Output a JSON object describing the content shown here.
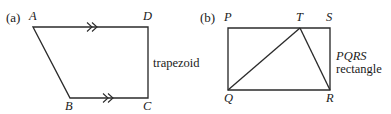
{
  "figure": {
    "width": 391,
    "height": 114,
    "background_color": "#ffffff",
    "stroke_color": "#2b2b2b",
    "text_color": "#1a1a1a"
  },
  "panel_a": {
    "part_label": "(a)",
    "part_label_pos": {
      "x": 6,
      "y": 22
    },
    "shape_name": "trapezoid",
    "caption": "trapezoid",
    "caption_pos": {
      "x": 153,
      "y": 67
    },
    "polygon_points": "33,27 148,27 148,98 70,98",
    "vertices": [
      {
        "name": "A",
        "label": "A",
        "x": 33,
        "y": 27,
        "label_x": 29,
        "label_y": 20
      },
      {
        "name": "D",
        "label": "D",
        "x": 148,
        "y": 27,
        "label_x": 143,
        "label_y": 20
      },
      {
        "name": "C",
        "label": "C",
        "x": 148,
        "y": 98,
        "label_x": 143,
        "label_y": 110
      },
      {
        "name": "B",
        "label": "B",
        "x": 70,
        "y": 98,
        "label_x": 65,
        "label_y": 110
      }
    ],
    "parallel_marks": [
      {
        "name": "parallel-mark-ad",
        "on_segment": "AD",
        "count": 2,
        "glyph": "double-chevron",
        "x": 92,
        "y": 27
      },
      {
        "name": "parallel-mark-bc",
        "on_segment": "BC",
        "count": 2,
        "glyph": "double-chevron",
        "x": 108,
        "y": 98
      }
    ]
  },
  "panel_b": {
    "part_label": "(b)",
    "part_label_pos": {
      "x": 200,
      "y": 22
    },
    "shape_name": "rectangle",
    "caption_line1": "PQRS",
    "caption_line2": "rectangle",
    "caption_pos": {
      "x": 336,
      "y": 60
    },
    "rect_points": "228,28 330,28 330,90 228,90",
    "vertices": [
      {
        "name": "P",
        "label": "P",
        "x": 228,
        "y": 28,
        "label_x": 224,
        "label_y": 21
      },
      {
        "name": "T",
        "label": "T",
        "x": 300,
        "y": 28,
        "label_x": 296,
        "label_y": 21
      },
      {
        "name": "S",
        "label": "S",
        "x": 330,
        "y": 28,
        "label_x": 326,
        "label_y": 21
      },
      {
        "name": "R",
        "label": "R",
        "x": 330,
        "y": 90,
        "label_x": 326,
        "label_y": 102
      },
      {
        "name": "Q",
        "label": "Q",
        "x": 228,
        "y": 90,
        "label_x": 224,
        "label_y": 102
      }
    ],
    "inner_segments": [
      {
        "name": "segment-qt",
        "from": "Q",
        "to": "T",
        "x1": 228,
        "y1": 90,
        "x2": 300,
        "y2": 28
      },
      {
        "name": "segment-tr",
        "from": "T",
        "to": "R",
        "x1": 300,
        "y1": 28,
        "x2": 330,
        "y2": 90
      }
    ]
  }
}
